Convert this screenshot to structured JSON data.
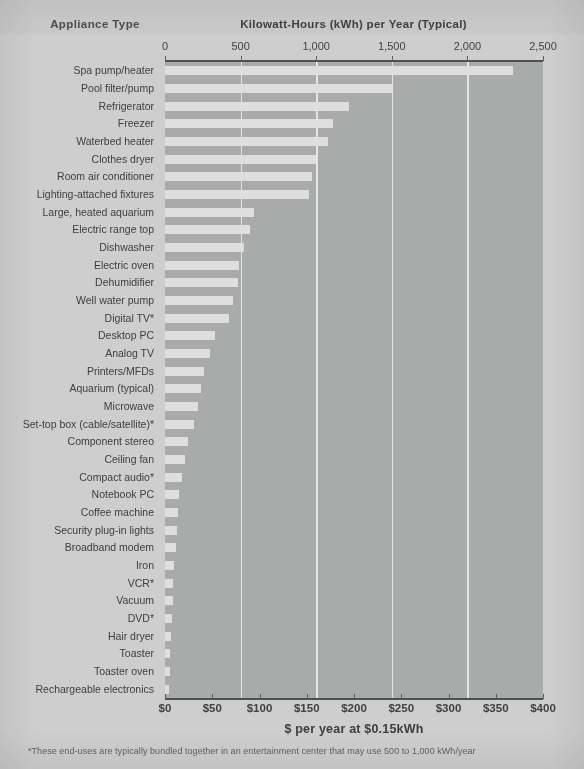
{
  "header": {
    "left_column_title": "Appliance Type",
    "main_title": "Kilowatt-Hours (kWh) per Year (Typical)"
  },
  "axis_bottom_title": "$ per year at $0.15kWh",
  "footnote": "*These end-uses are typically bundled together in an entertainment center that may use 500 to 1,000 kWh/year",
  "colors": {
    "page_background": "#cdcecd",
    "plot_background": "#a9abaa",
    "bar_fill": "#dedfdd",
    "gridline": "#e9eae8",
    "axis_line": "#4c5154",
    "text": "#3c4043"
  },
  "chart_data": {
    "type": "bar",
    "orientation": "horizontal",
    "title": "Kilowatt-Hours (kWh) per Year (Typical)",
    "xlabel": "Kilowatt-Hours (kWh) per Year (Typical)",
    "ylabel": "Appliance Type",
    "xlabel_secondary": "$ per year at $0.15kWh",
    "xlim": [
      0,
      2500
    ],
    "xlim_secondary": [
      0,
      400
    ],
    "xticks": [
      0,
      500,
      1000,
      1500,
      2000,
      2500
    ],
    "xticklabels": [
      "0",
      "500",
      "1,000",
      "1,500",
      "2,000",
      "2,500"
    ],
    "xticks_secondary": [
      0,
      50,
      100,
      150,
      200,
      250,
      300,
      350,
      400
    ],
    "xticklabels_secondary": [
      "$0",
      "$50",
      "$100",
      "$150",
      "$200",
      "$250",
      "$300",
      "$350",
      "$400"
    ],
    "grid": "vertical-only",
    "gridline_values": [
      500,
      1000,
      1500,
      2000
    ],
    "legend": "none",
    "categories": [
      "Spa pump/heater",
      "Pool filter/pump",
      "Refrigerator",
      "Freezer",
      "Waterbed heater",
      "Clothes dryer",
      "Room air conditioner",
      "Lighting-attached fixtures",
      "Large, heated aquarium",
      "Electric range top",
      "Dishwasher",
      "Electric oven",
      "Dehumidifier",
      "Well water pump",
      "Digital TV*",
      "Desktop PC",
      "Analog TV",
      "Printers/MFDs",
      "Aquarium (typical)",
      "Microwave",
      "Set-top box (cable/satellite)*",
      "Component stereo",
      "Ceiling fan",
      "Compact audio*",
      "Notebook PC",
      "Coffee machine",
      "Security plug-in lights",
      "Broadband modem",
      "Iron",
      "VCR*",
      "Vacuum",
      "DVD*",
      "Hair dryer",
      "Toaster",
      "Toaster oven",
      "Rechargeable electronics"
    ],
    "values": [
      2300,
      1500,
      1215,
      1110,
      1080,
      1000,
      975,
      955,
      590,
      565,
      520,
      490,
      480,
      450,
      420,
      330,
      295,
      260,
      235,
      215,
      190,
      150,
      130,
      110,
      95,
      85,
      78,
      72,
      62,
      56,
      50,
      46,
      40,
      36,
      30,
      26
    ],
    "units": "kWh per year"
  }
}
